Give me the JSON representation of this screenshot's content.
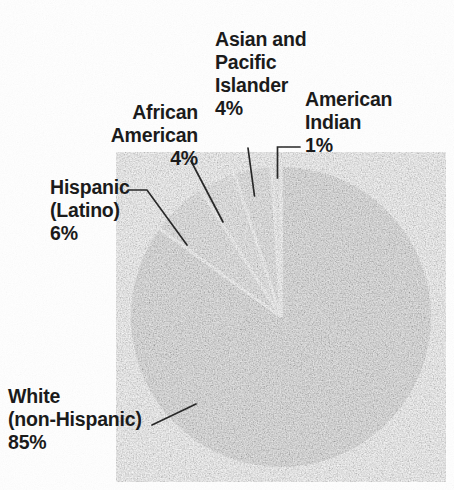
{
  "chart_data": {
    "type": "pie",
    "title": "",
    "subtitle": "",
    "xlabel": "",
    "ylabel": "",
    "units": "percent",
    "legend_position": "none",
    "labels_position": "outside-with-leader-lines",
    "grid": false,
    "start_angle_deg": 90,
    "direction": "counterclockwise",
    "categories": [
      "White (non-Hispanic)",
      "Hispanic (Latino)",
      "African American",
      "Asian and Pacific Islander",
      "American Indian"
    ],
    "values": [
      85,
      6,
      4,
      4,
      1
    ],
    "value_labels": [
      "85%",
      "6%",
      "4%",
      "4%",
      "1%"
    ],
    "slices": [
      {
        "name": "White (non-Hispanic)",
        "value": 85,
        "value_label": "85%",
        "color": "#343434",
        "label_lines": [
          "White",
          "(non-Hispanic)",
          "85%"
        ]
      },
      {
        "name": "Hispanic (Latino)",
        "value": 6,
        "value_label": "6%",
        "color": "#8a8a8a",
        "label_lines": [
          "Hispanic",
          "(Latino)",
          "6%"
        ]
      },
      {
        "name": "African American",
        "value": 4,
        "value_label": "4%",
        "color": "#a9a9a9",
        "label_lines": [
          "African",
          "American",
          "4%"
        ]
      },
      {
        "name": "Asian and Pacific Islander",
        "value": 4,
        "value_label": "4%",
        "color": "#8f8f8f",
        "label_lines": [
          "Asian and",
          "Pacific",
          "Islander",
          "4%"
        ]
      },
      {
        "name": "American Indian",
        "value": 1,
        "value_label": "1%",
        "color": "#d9d9d9",
        "label_lines": [
          "American",
          "Indian",
          "1%"
        ]
      }
    ],
    "colors": {
      "background": "#ffffff",
      "text": "#1b1b1b",
      "leader_line": "#222222",
      "slice_gap": "#ffffff"
    }
  },
  "labels": {
    "white": {
      "l1": "White",
      "l2": "(non-Hispanic)",
      "l3": "85%"
    },
    "hispanic": {
      "l1": "Hispanic",
      "l2": "(Latino)",
      "l3": "6%"
    },
    "african_american": {
      "l1": "African",
      "l2": "American",
      "l3": "4%"
    },
    "asian_pacific": {
      "l1": "Asian and",
      "l2": "Pacific",
      "l3": "Islander",
      "l4": "4%"
    },
    "american_indian": {
      "l1": "American",
      "l2": "Indian",
      "l3": "1%"
    }
  }
}
